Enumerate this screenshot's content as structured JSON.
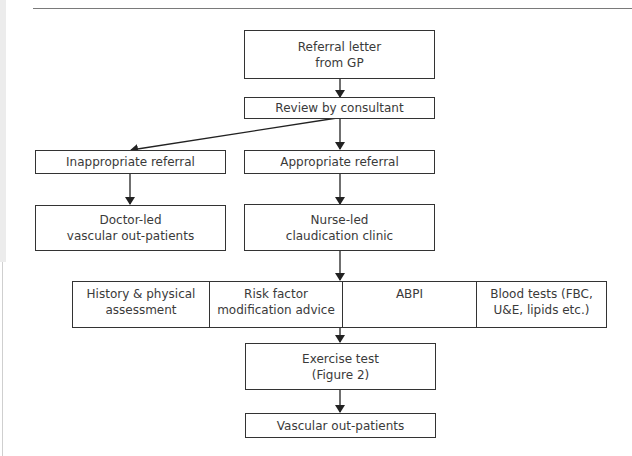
{
  "flowchart": {
    "nodes": {
      "referral_letter": "Referral letter\nfrom GP",
      "review": "Review by consultant",
      "inappropriate": "Inappropriate referral",
      "appropriate": "Appropriate referral",
      "doctor_led": "Doctor-led\nvascular out-patients",
      "nurse_led": "Nurse-led\nclaudication clinic",
      "assessments": [
        {
          "label": "History & physical\nassessment"
        },
        {
          "label": "Risk factor\nmodification advice"
        },
        {
          "label": "ABPI"
        },
        {
          "label": "Blood tests (FBC,\nU&E, lipids etc.)"
        }
      ],
      "exercise_test": "Exercise test\n(Figure 2)",
      "vascular_outpatients": "Vascular out-patients"
    },
    "edges": [
      [
        "referral_letter",
        "review"
      ],
      [
        "review",
        "inappropriate"
      ],
      [
        "review",
        "appropriate"
      ],
      [
        "inappropriate",
        "doctor_led"
      ],
      [
        "appropriate",
        "nurse_led"
      ],
      [
        "nurse_led",
        "assessments"
      ],
      [
        "assessments",
        "exercise_test"
      ],
      [
        "exercise_test",
        "vascular_outpatients"
      ]
    ]
  }
}
